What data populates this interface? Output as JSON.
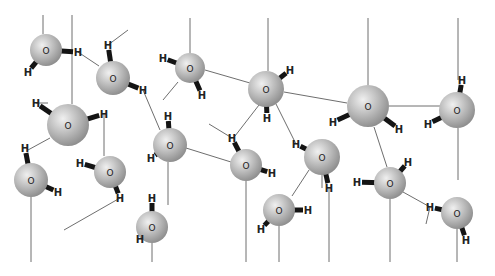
{
  "diagram": {
    "atom_labels": {
      "oxygen": "O",
      "hydrogen": "H"
    },
    "colors": {
      "oxygen_light": "#f0f0f0",
      "oxygen_mid": "#b8b8b8",
      "oxygen_dark": "#8a8a8a",
      "covalent_bond": "#141414",
      "hydrogen_bond": "#6e6e6e",
      "background": "#ffffff"
    },
    "molecules": [
      {
        "id": "w1",
        "o": [
          46,
          50
        ],
        "r": 16,
        "h": [
          [
            78,
            52
          ],
          [
            28,
            72
          ]
        ]
      },
      {
        "id": "w2",
        "o": [
          113,
          78
        ],
        "r": 17,
        "h": [
          [
            108,
            45
          ],
          [
            143,
            90
          ]
        ]
      },
      {
        "id": "w3",
        "o": [
          68,
          125
        ],
        "r": 21,
        "h": [
          [
            36,
            103
          ],
          [
            104,
            114
          ]
        ]
      },
      {
        "id": "w4",
        "o": [
          190,
          68
        ],
        "r": 15,
        "h": [
          [
            163,
            58
          ],
          [
            202,
            95
          ]
        ]
      },
      {
        "id": "w5",
        "o": [
          266,
          89
        ],
        "r": 18,
        "h": [
          [
            290,
            70
          ],
          [
            267,
            118
          ]
        ]
      },
      {
        "id": "w6",
        "o": [
          368,
          106
        ],
        "r": 21,
        "h": [
          [
            333,
            122
          ],
          [
            399,
            129
          ]
        ]
      },
      {
        "id": "w7",
        "o": [
          457,
          110
        ],
        "r": 18,
        "h": [
          [
            462,
            80
          ],
          [
            428,
            124
          ]
        ]
      },
      {
        "id": "w8",
        "o": [
          170,
          145
        ],
        "r": 17,
        "h": [
          [
            168,
            116
          ],
          [
            151,
            158
          ]
        ]
      },
      {
        "id": "w9",
        "o": [
          110,
          172
        ],
        "r": 16,
        "h": [
          [
            80,
            163
          ],
          [
            120,
            198
          ]
        ]
      },
      {
        "id": "w10",
        "o": [
          31,
          180
        ],
        "r": 17,
        "h": [
          [
            25,
            148
          ],
          [
            58,
            192
          ]
        ]
      },
      {
        "id": "w11",
        "o": [
          246,
          165
        ],
        "r": 16,
        "h": [
          [
            232,
            138
          ],
          [
            272,
            173
          ]
        ]
      },
      {
        "id": "w12",
        "o": [
          322,
          157
        ],
        "r": 18,
        "h": [
          [
            296,
            144
          ],
          [
            329,
            188
          ]
        ]
      },
      {
        "id": "w13",
        "o": [
          390,
          183
        ],
        "r": 16,
        "h": [
          [
            408,
            162
          ],
          [
            357,
            182
          ]
        ]
      },
      {
        "id": "w14",
        "o": [
          279,
          210
        ],
        "r": 16,
        "h": [
          [
            308,
            210
          ],
          [
            261,
            229
          ]
        ]
      },
      {
        "id": "w15",
        "o": [
          152,
          227
        ],
        "r": 16,
        "h": [
          [
            152,
            198
          ],
          [
            140,
            239
          ]
        ]
      },
      {
        "id": "w16",
        "o": [
          457,
          213
        ],
        "r": 16,
        "h": [
          [
            430,
            207
          ],
          [
            466,
            240
          ]
        ]
      }
    ],
    "hydrogen_bonds": [
      [
        [
          43,
          15
        ],
        [
          43,
          34
        ]
      ],
      [
        [
          72,
          15
        ],
        [
          72,
          104
        ]
      ],
      [
        [
          78,
          52
        ],
        [
          99,
          66
        ]
      ],
      [
        [
          108,
          45
        ],
        [
          128,
          30
        ]
      ],
      [
        [
          143,
          90
        ],
        [
          160,
          130
        ]
      ],
      [
        [
          104,
          114
        ],
        [
          104,
          156
        ]
      ],
      [
        [
          36,
          103
        ],
        [
          48,
          103
        ]
      ],
      [
        [
          28,
          150
        ],
        [
          50,
          138
        ]
      ],
      [
        [
          31,
          197
        ],
        [
          31,
          262
        ]
      ],
      [
        [
          120,
          198
        ],
        [
          64,
          230
        ]
      ],
      [
        [
          190,
          18
        ],
        [
          190,
          53
        ]
      ],
      [
        [
          205,
          70
        ],
        [
          250,
          83
        ]
      ],
      [
        [
          178,
          82
        ],
        [
          163,
          100
        ]
      ],
      [
        [
          168,
          162
        ],
        [
          168,
          205
        ]
      ],
      [
        [
          186,
          148
        ],
        [
          231,
          162
        ]
      ],
      [
        [
          152,
          243
        ],
        [
          152,
          262
        ]
      ],
      [
        [
          268,
          18
        ],
        [
          268,
          71
        ]
      ],
      [
        [
          284,
          92
        ],
        [
          347,
          103
        ]
      ],
      [
        [
          259,
          105
        ],
        [
          235,
          136
        ]
      ],
      [
        [
          232,
          138
        ],
        [
          209,
          124
        ]
      ],
      [
        [
          276,
          104
        ],
        [
          296,
          144
        ]
      ],
      [
        [
          246,
          181
        ],
        [
          246,
          262
        ]
      ],
      [
        [
          368,
          18
        ],
        [
          368,
          85
        ]
      ],
      [
        [
          389,
          106
        ],
        [
          440,
          106
        ]
      ],
      [
        [
          458,
          18
        ],
        [
          458,
          80
        ]
      ],
      [
        [
          458,
          128
        ],
        [
          458,
          180
        ]
      ],
      [
        [
          374,
          127
        ],
        [
          387,
          167
        ]
      ],
      [
        [
          322,
          175
        ],
        [
          322,
          188
        ]
      ],
      [
        [
          329,
          188
        ],
        [
          329,
          262
        ]
      ],
      [
        [
          309,
          170
        ],
        [
          292,
          196
        ]
      ],
      [
        [
          279,
          226
        ],
        [
          279,
          262
        ]
      ],
      [
        [
          390,
          199
        ],
        [
          390,
          262
        ]
      ],
      [
        [
          403,
          192
        ],
        [
          430,
          207
        ]
      ],
      [
        [
          430,
          207
        ],
        [
          426,
          224
        ]
      ],
      [
        [
          457,
          229
        ],
        [
          457,
          262
        ]
      ]
    ]
  }
}
